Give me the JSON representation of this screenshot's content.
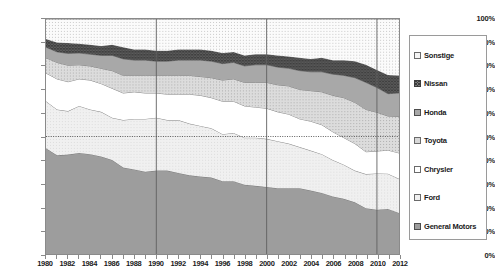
{
  "chart_data": {
    "type": "area",
    "stacked": true,
    "normalized_percent": true,
    "title": "",
    "xlabel": "",
    "ylabel": "",
    "ylim": [
      0,
      100
    ],
    "ytick_labels": [
      "0%",
      "10%",
      "20%",
      "30%",
      "40%",
      "50%",
      "60%",
      "70%",
      "80%",
      "90%",
      "100%"
    ],
    "ytick_values": [
      0,
      10,
      20,
      30,
      40,
      50,
      60,
      70,
      80,
      90,
      100
    ],
    "grid": "vertical gridlines at 1990, 2000, 2010; dotted reference line at 50%",
    "reference_line_value": 50,
    "vertical_gridline_years": [
      1990,
      2000,
      2010
    ],
    "legend_position": "right outside",
    "x": [
      1980,
      1981,
      1982,
      1983,
      1984,
      1985,
      1986,
      1987,
      1988,
      1989,
      1990,
      1991,
      1992,
      1993,
      1994,
      1995,
      1996,
      1997,
      1998,
      1999,
      2000,
      2001,
      2002,
      2003,
      2004,
      2005,
      2006,
      2007,
      2008,
      2009,
      2010,
      2011,
      2012
    ],
    "xtick_labels": [
      "1980",
      "1982",
      "1984",
      "1986",
      "1988",
      "1990",
      "1992",
      "1994",
      "1996",
      "1998",
      "2000",
      "2002",
      "2004",
      "2006",
      "2008",
      "2010",
      "2012"
    ],
    "series": [
      {
        "name": "General Motors",
        "fill": "#9d9d9d",
        "pattern": "solid",
        "values": [
          45.0,
          42.0,
          42.3,
          43.0,
          42.5,
          41.5,
          40.0,
          36.8,
          36.0,
          35.0,
          35.5,
          35.5,
          34.5,
          33.5,
          33.0,
          32.5,
          31.0,
          31.0,
          29.5,
          29.0,
          28.5,
          28.0,
          28.0,
          28.0,
          27.0,
          26.0,
          24.5,
          23.5,
          22.0,
          19.5,
          18.8,
          19.2,
          17.5
        ]
      },
      {
        "name": "Ford",
        "fill": "#efefef",
        "pattern": "solid-light",
        "values": [
          20.0,
          19.5,
          18.5,
          20.0,
          19.0,
          19.0,
          18.0,
          20.2,
          21.5,
          22.5,
          22.5,
          21.5,
          22.5,
          22.0,
          21.5,
          21.0,
          20.0,
          20.5,
          20.0,
          20.5,
          20.5,
          20.0,
          19.0,
          17.5,
          17.0,
          16.5,
          15.5,
          14.5,
          13.5,
          14.5,
          15.5,
          15.0,
          14.5
        ]
      },
      {
        "name": "Chrysler",
        "fill": "#ffffff",
        "pattern": "white",
        "values": [
          12.0,
          13.0,
          12.5,
          11.5,
          12.5,
          12.0,
          12.5,
          11.5,
          11.5,
          11.0,
          10.5,
          11.0,
          11.0,
          12.5,
          13.0,
          13.0,
          14.0,
          13.5,
          13.5,
          13.0,
          13.0,
          12.5,
          12.5,
          12.0,
          12.5,
          12.5,
          12.0,
          11.5,
          11.5,
          9.5,
          9.5,
          10.0,
          11.0
        ]
      },
      {
        "name": "Toyota",
        "fill": "#d2d2d2",
        "pattern": "dotted-light",
        "values": [
          6.5,
          7.0,
          7.0,
          6.0,
          6.0,
          6.5,
          7.5,
          7.5,
          7.0,
          7.5,
          7.5,
          8.0,
          8.0,
          8.0,
          8.0,
          8.5,
          9.0,
          9.5,
          10.0,
          10.5,
          11.0,
          11.5,
          12.0,
          12.5,
          13.0,
          14.0,
          15.5,
          17.0,
          17.5,
          18.0,
          16.5,
          14.5,
          15.5
        ]
      },
      {
        "name": "Honda",
        "fill": "#a8a8a8",
        "pattern": "solid-mid",
        "values": [
          4.5,
          4.5,
          5.0,
          5.0,
          5.0,
          5.5,
          6.5,
          7.0,
          6.5,
          6.5,
          6.0,
          6.0,
          6.5,
          6.5,
          7.0,
          7.0,
          7.0,
          7.0,
          7.0,
          7.5,
          7.5,
          7.5,
          7.5,
          8.0,
          8.0,
          8.5,
          9.0,
          9.5,
          10.5,
          11.5,
          10.5,
          9.5,
          10.0
        ]
      },
      {
        "name": "Nissan",
        "fill": "#6e6e6e",
        "pattern": "crosshatch",
        "values": [
          3.5,
          4.0,
          4.5,
          4.0,
          4.0,
          4.0,
          4.5,
          5.0,
          4.5,
          4.5,
          4.5,
          4.5,
          4.5,
          4.5,
          4.5,
          4.5,
          4.5,
          4.5,
          4.5,
          4.5,
          4.5,
          5.0,
          5.0,
          5.5,
          5.5,
          6.0,
          6.0,
          6.5,
          7.0,
          7.5,
          7.5,
          8.0,
          7.5
        ]
      },
      {
        "name": "Sonstige",
        "fill": "#f2f2f2",
        "pattern": "dotted-sparse",
        "values": [
          8.5,
          10.0,
          10.2,
          10.5,
          11.0,
          11.5,
          11.0,
          12.0,
          13.0,
          13.0,
          13.5,
          13.5,
          13.0,
          13.0,
          13.0,
          13.5,
          14.5,
          14.0,
          15.5,
          15.0,
          15.0,
          15.5,
          16.0,
          16.5,
          17.0,
          16.5,
          17.5,
          17.5,
          18.0,
          19.5,
          21.7,
          23.8,
          24.0
        ]
      }
    ]
  },
  "legend": {
    "items": [
      {
        "label": "Sonstige"
      },
      {
        "label": "Nissan"
      },
      {
        "label": "Honda"
      },
      {
        "label": "Toyota"
      },
      {
        "label": "Chrysler"
      },
      {
        "label": "Ford"
      },
      {
        "label": "General Motors"
      }
    ]
  }
}
